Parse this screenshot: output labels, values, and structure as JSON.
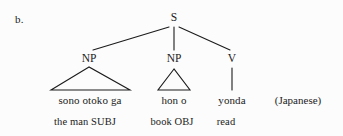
{
  "figure": {
    "label": "b.",
    "language_note": "(Japanese)",
    "ink_color": "#1b1b1b",
    "background_color": "#fcfcfc"
  },
  "tree": {
    "root": {
      "label": "S",
      "x": 174,
      "y": 19
    },
    "nodes": [
      {
        "name": "subject-np",
        "label": "NP",
        "x": 89,
        "y": 60
      },
      {
        "name": "object-np",
        "label": "NP",
        "x": 174,
        "y": 60
      },
      {
        "name": "verb",
        "label": "V",
        "x": 232,
        "y": 60
      }
    ],
    "branches": [
      {
        "from": "S",
        "to": "NP",
        "x1": 169,
        "y1": 27,
        "x2": 93,
        "y2": 50
      },
      {
        "from": "S",
        "to": "NP",
        "x1": 174,
        "y1": 27,
        "x2": 174,
        "y2": 50
      },
      {
        "from": "S",
        "to": "V",
        "x1": 179,
        "y1": 27,
        "x2": 230,
        "y2": 50
      }
    ],
    "triangles": [
      {
        "name": "subject-np-triangle",
        "apex_x": 89,
        "apex_y": 67,
        "base_left_x": 51,
        "base_right_x": 130,
        "base_y": 90
      },
      {
        "name": "object-np-triangle",
        "apex_x": 174,
        "apex_y": 69,
        "base_left_x": 158,
        "base_right_x": 190,
        "base_y": 90
      }
    ],
    "stems": [
      {
        "name": "verb-stem",
        "x": 232,
        "y1": 68,
        "y2": 90
      }
    ]
  },
  "terminals": [
    {
      "name": "subject-words",
      "text": "sono otoko ga",
      "x": 90,
      "y": 94
    },
    {
      "name": "object-words",
      "text": "hon o",
      "x": 174,
      "y": 94
    },
    {
      "name": "verb-word",
      "text": "yonda",
      "x": 232,
      "y": 94
    }
  ],
  "glosses": [
    {
      "name": "subject-gloss",
      "text": "the man SUBJ",
      "x": 85,
      "y": 116
    },
    {
      "name": "object-gloss",
      "text": "book OBJ",
      "x": 172,
      "y": 116
    },
    {
      "name": "verb-gloss",
      "text": "read",
      "x": 226,
      "y": 116
    }
  ],
  "language_note_pos": {
    "x": 298,
    "y": 94
  }
}
